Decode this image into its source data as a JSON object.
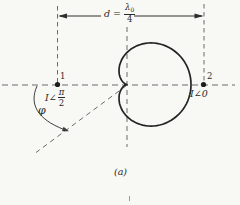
{
  "figure": {
    "caption": "(a)",
    "dimension": {
      "prefix": "d =",
      "numerator_symbol": "λ",
      "numerator_sub": "0",
      "denominator": "4"
    },
    "element1": {
      "label": "1",
      "current_prefix": "I∠",
      "current_numerator": "π",
      "current_denominator": "2"
    },
    "element2": {
      "label": "2",
      "current": "I∠0"
    },
    "angle_label": "φ"
  },
  "colors": {
    "solid_line": "#2e2e2e",
    "dashed_line": "#6b6b6b",
    "background": "#f8f8f5"
  },
  "cardioid": {
    "cx": 127,
    "cy": 84.5,
    "a": 32
  }
}
